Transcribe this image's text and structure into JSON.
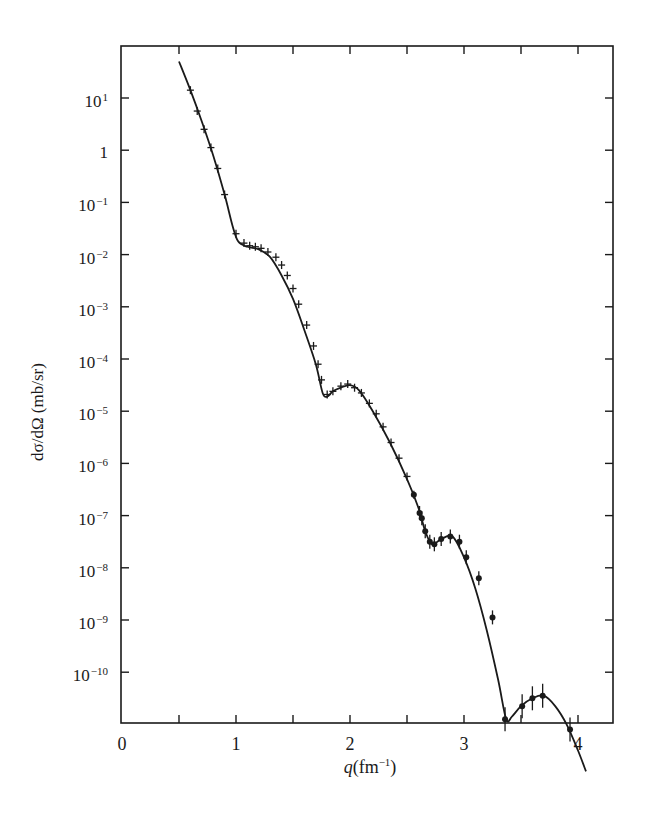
{
  "chart_data": {
    "type": "line",
    "title": "",
    "xlabel": "q(fm^-1)",
    "xlabel_parts": {
      "var": "q",
      "open": "(fm",
      "exp": "−1",
      "close": ")"
    },
    "ylabel": "dσ/dΩ (mb/sr)",
    "xscale": "linear",
    "yscale": "log",
    "xlim": [
      0,
      4.2
    ],
    "ylim": [
      1e-11,
      100
    ],
    "grid": false,
    "legend": null,
    "x_ticks": [
      "0",
      "1",
      "2",
      "3",
      "4"
    ],
    "x_minor_ticks": [
      0.5,
      1.5,
      2.5,
      3.5
    ],
    "y_ticks": [
      {
        "base": "10",
        "exp": "1",
        "value": 10
      },
      {
        "base": "1",
        "exp": "",
        "value": 1
      },
      {
        "base": "10",
        "exp": "−1",
        "value": 0.1
      },
      {
        "base": "10",
        "exp": "−2",
        "value": 0.01
      },
      {
        "base": "10",
        "exp": "−3",
        "value": 0.001
      },
      {
        "base": "10",
        "exp": "−4",
        "value": 0.0001
      },
      {
        "base": "10",
        "exp": "−5",
        "value": 1e-05
      },
      {
        "base": "10",
        "exp": "−6",
        "value": 1e-06
      },
      {
        "base": "10",
        "exp": "−7",
        "value": 1e-07
      },
      {
        "base": "10",
        "exp": "−8",
        "value": 1e-08
      },
      {
        "base": "10",
        "exp": "−9",
        "value": 1e-09
      },
      {
        "base": "10",
        "exp": "−10",
        "value": 1e-10
      }
    ],
    "series": [
      {
        "name": "theory curve",
        "style": "solid line",
        "x": [
          0.5,
          0.6,
          0.7,
          0.8,
          0.9,
          0.97,
          1.02,
          1.1,
          1.2,
          1.3,
          1.4,
          1.5,
          1.6,
          1.7,
          1.76,
          1.8,
          1.85,
          1.92,
          2.0,
          2.08,
          2.2,
          2.35,
          2.5,
          2.6,
          2.66,
          2.72,
          2.8,
          2.9,
          3.0,
          3.1,
          3.2,
          3.3,
          3.37,
          3.42,
          3.5,
          3.6,
          3.7,
          3.8,
          3.9,
          4.0,
          4.07
        ],
        "log10_y": [
          1.7,
          1.15,
          0.55,
          -0.1,
          -0.85,
          -1.45,
          -1.75,
          -1.85,
          -1.9,
          -2.05,
          -2.4,
          -2.85,
          -3.45,
          -4.1,
          -4.65,
          -4.72,
          -4.62,
          -4.55,
          -4.5,
          -4.6,
          -5.0,
          -5.6,
          -6.3,
          -6.85,
          -7.3,
          -7.55,
          -7.45,
          -7.4,
          -7.8,
          -8.4,
          -9.2,
          -10.15,
          -10.9,
          -10.85,
          -10.65,
          -10.5,
          -10.45,
          -10.65,
          -11.0,
          -11.5,
          -11.9
        ]
      },
      {
        "name": "measured data",
        "style": "markers with error bars",
        "x": [
          0.6,
          0.66,
          0.72,
          0.78,
          0.84,
          0.9,
          1.0,
          1.07,
          1.12,
          1.17,
          1.22,
          1.28,
          1.35,
          1.4,
          1.45,
          1.5,
          1.55,
          1.62,
          1.68,
          1.72,
          1.75,
          1.8,
          1.85,
          1.92,
          1.98,
          2.04,
          2.1,
          2.17,
          2.23,
          2.29,
          2.36,
          2.43,
          2.5,
          2.56,
          2.61,
          2.63,
          2.66,
          2.7,
          2.74,
          2.8,
          2.88,
          2.96,
          3.02,
          3.13,
          3.25,
          3.36,
          3.51,
          3.6,
          3.69,
          3.93
        ],
        "log10_y": [
          1.15,
          0.75,
          0.4,
          0.05,
          -0.35,
          -0.85,
          -1.6,
          -1.78,
          -1.83,
          -1.85,
          -1.88,
          -1.95,
          -2.05,
          -2.2,
          -2.4,
          -2.65,
          -2.95,
          -3.35,
          -3.75,
          -4.1,
          -4.4,
          -4.68,
          -4.62,
          -4.52,
          -4.48,
          -4.55,
          -4.65,
          -4.85,
          -5.05,
          -5.3,
          -5.6,
          -5.9,
          -6.25,
          -6.6,
          -6.95,
          -7.05,
          -7.3,
          -7.5,
          -7.55,
          -7.45,
          -7.4,
          -7.5,
          -7.8,
          -8.2,
          -8.95,
          -10.9,
          -10.65,
          -10.5,
          -10.45,
          -11.1
        ]
      }
    ]
  },
  "axes": {
    "ylabel_text": "dσ/dΩ (mb/sr)"
  }
}
